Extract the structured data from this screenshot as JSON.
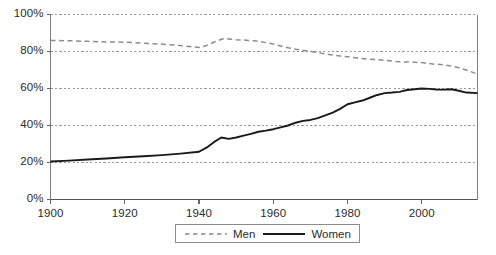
{
  "chart_data": {
    "type": "line",
    "title": "",
    "subtitle": "",
    "xlabel": "",
    "ylabel": "",
    "xlim": [
      1900,
      2015
    ],
    "ylim": [
      0,
      100
    ],
    "grid": true,
    "grid_axis": "y",
    "legend_position": "bottom-center",
    "y_tick_labels": [
      "100%",
      "80%",
      "60%",
      "40%",
      "20%",
      "0%"
    ],
    "y_tick_values": [
      100,
      80,
      60,
      40,
      20,
      0
    ],
    "x_tick_labels": [
      "1900",
      "1920",
      "1940",
      "1960",
      "1980",
      "2000"
    ],
    "x_tick_values": [
      1900,
      1920,
      1940,
      1960,
      1980,
      2000
    ],
    "series": [
      {
        "name": "Men",
        "style": "dashed",
        "color": "#8c8c8c",
        "x": [
          1900,
          1905,
          1910,
          1915,
          1920,
          1925,
          1930,
          1935,
          1940,
          1942,
          1944,
          1946,
          1947,
          1948,
          1950,
          1952,
          1955,
          1958,
          1960,
          1962,
          1964,
          1966,
          1968,
          1970,
          1972,
          1975,
          1978,
          1980,
          1983,
          1985,
          1988,
          1990,
          1993,
          1995,
          1998,
          2000,
          2003,
          2005,
          2008,
          2010,
          2012,
          2015
        ],
        "values": [
          86.0,
          85.8,
          85.5,
          85.2,
          85.0,
          84.5,
          84.0,
          83.2,
          82.2,
          83.2,
          85.0,
          86.6,
          87.0,
          86.8,
          86.4,
          86.2,
          85.8,
          84.8,
          84.0,
          83.0,
          82.0,
          81.2,
          80.6,
          80.0,
          79.4,
          78.4,
          77.6,
          77.2,
          76.4,
          76.0,
          75.6,
          75.2,
          74.6,
          74.4,
          74.2,
          74.0,
          73.2,
          73.0,
          72.2,
          71.2,
          70.0,
          67.8
        ]
      },
      {
        "name": "Women",
        "style": "solid",
        "color": "#1a1a1a",
        "x": [
          1900,
          1905,
          1910,
          1915,
          1920,
          1925,
          1930,
          1935,
          1940,
          1942,
          1944,
          1946,
          1948,
          1950,
          1952,
          1954,
          1956,
          1958,
          1960,
          1962,
          1964,
          1966,
          1968,
          1970,
          1972,
          1974,
          1976,
          1978,
          1980,
          1982,
          1984,
          1986,
          1988,
          1990,
          1992,
          1994,
          1996,
          1998,
          2000,
          2002,
          2004,
          2006,
          2008,
          2010,
          2012,
          2015
        ],
        "values": [
          20.5,
          21.0,
          21.6,
          22.2,
          22.8,
          23.4,
          24.0,
          24.8,
          25.8,
          28.0,
          31.0,
          33.5,
          32.8,
          33.5,
          34.5,
          35.5,
          36.6,
          37.2,
          38.0,
          39.0,
          40.0,
          41.5,
          42.5,
          43.0,
          44.0,
          45.5,
          47.0,
          49.0,
          51.5,
          52.5,
          53.5,
          55.0,
          56.5,
          57.5,
          57.8,
          58.2,
          59.2,
          59.6,
          60.0,
          59.8,
          59.5,
          59.4,
          59.6,
          58.8,
          57.8,
          57.5
        ]
      }
    ]
  },
  "legend": {
    "entries": [
      {
        "label": "Men",
        "style": "dashed",
        "color": "#8c8c8c"
      },
      {
        "label": "Women",
        "style": "solid",
        "color": "#1a1a1a"
      }
    ]
  }
}
